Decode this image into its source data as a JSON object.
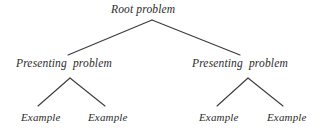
{
  "diagram": {
    "type": "hierarchy-tree",
    "background_color": "#ffffff",
    "line_color": "#3a3a3a",
    "text_color": "#2b2b2b",
    "levels": 3,
    "root": {
      "label": "Root problem"
    },
    "mid": [
      {
        "label": "Presenting  problem"
      },
      {
        "label": "Presenting  problem"
      }
    ],
    "leaves": [
      {
        "label": "Example"
      },
      {
        "label": "Example"
      },
      {
        "label": "Example"
      },
      {
        "label": "Example"
      }
    ]
  }
}
